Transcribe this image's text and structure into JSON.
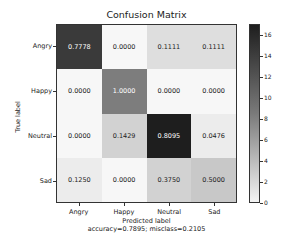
{
  "chart_data": {
    "type": "heatmap",
    "title": "Confusion Matrix",
    "xlabel": "Predicted label",
    "ylabel": "True label",
    "subtitle": "accuracy=0.7895; misclass=0.2105",
    "x_categories": [
      "Angry",
      "Happy",
      "Neutral",
      "Sad"
    ],
    "y_categories": [
      "Angry",
      "Happy",
      "Neutral",
      "Sad"
    ],
    "values": [
      [
        "0.7778",
        "0.0000",
        "0.1111",
        "0.1111"
      ],
      [
        "0.0000",
        "1.0000",
        "0.0000",
        "0.0000"
      ],
      [
        "0.0000",
        "0.1429",
        "0.8095",
        "0.0476"
      ],
      [
        "0.1250",
        "0.0000",
        "0.3750",
        "0.5000"
      ]
    ],
    "cell_colors": [
      [
        "#3a3a3a",
        "#f7f7f7",
        "#dedede",
        "#dedede"
      ],
      [
        "#f7f7f7",
        "#7d7d7d",
        "#f7f7f7",
        "#f7f7f7"
      ],
      [
        "#f7f7f7",
        "#d2d2d2",
        "#1e1e1e",
        "#ececec"
      ],
      [
        "#ececec",
        "#f7f7f7",
        "#d2d2d2",
        "#c8c8c8"
      ]
    ],
    "text_colors": [
      [
        "#ffffff",
        "#222222",
        "#222222",
        "#222222"
      ],
      [
        "#222222",
        "#ffffff",
        "#222222",
        "#222222"
      ],
      [
        "#222222",
        "#222222",
        "#ffffff",
        "#222222"
      ],
      [
        "#222222",
        "#222222",
        "#222222",
        "#222222"
      ]
    ],
    "colorbar": {
      "min": 0,
      "max": 17,
      "ticks": [
        "16",
        "14",
        "12",
        "10",
        "8",
        "6",
        "4",
        "2",
        "0"
      ],
      "colormap": "Greys"
    },
    "grid": false
  }
}
